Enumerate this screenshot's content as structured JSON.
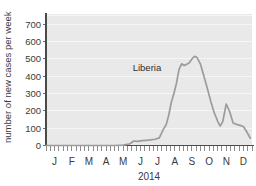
{
  "chart_data": {
    "type": "line",
    "title": "",
    "subtitle": "",
    "xlabel": "2014",
    "ylabel": "number of new cases per week",
    "ylim": [
      0,
      760
    ],
    "ytick_values": [
      0,
      100,
      200,
      300,
      400,
      500,
      600,
      700
    ],
    "ytick_labels": [
      "0",
      "100",
      "200",
      "300",
      "400",
      "500",
      "600",
      "700"
    ],
    "xtick_labels": [
      "J",
      "F",
      "M",
      "A",
      "M",
      "J",
      "J",
      "A",
      "S",
      "O",
      "N",
      "D"
    ],
    "xtick_full_names": [
      "January",
      "February",
      "March",
      "April",
      "May",
      "June",
      "July",
      "August",
      "September",
      "October",
      "November",
      "December"
    ],
    "xlim_months": [
      0,
      12
    ],
    "grid": "horizontal-light",
    "legend_position": "inline-annotation",
    "minor_ticks_per_month": 4,
    "plot_background_color": "#e9e9e9",
    "line_color": "#9c9c9c",
    "axis_color": "#4a4a4a",
    "text_color": "#3a3a3a",
    "series": [
      {
        "name": "Liberia",
        "annotation_label": "Liberia",
        "annotation_x_month": 5.05,
        "annotation_y_value": 430,
        "x_months": [
          0.0,
          0.5,
          1.0,
          1.5,
          2.0,
          2.5,
          3.0,
          3.5,
          4.0,
          4.5,
          4.9,
          5.1,
          5.35,
          5.6,
          5.85,
          6.1,
          6.35,
          6.6,
          6.85,
          7.0,
          7.15,
          7.3,
          7.45,
          7.6,
          7.75,
          7.9,
          8.05,
          8.2,
          8.35,
          8.5,
          8.65,
          8.8,
          9.0,
          9.2,
          9.4,
          9.6,
          9.8,
          10.0,
          10.15,
          10.3,
          10.5,
          10.7,
          10.9,
          11.1,
          11.3,
          11.5,
          11.7,
          11.9
        ],
        "values": [
          0,
          0,
          0,
          0,
          0,
          0,
          0,
          0,
          0,
          2,
          10,
          26,
          24,
          28,
          30,
          32,
          36,
          44,
          96,
          120,
          175,
          250,
          300,
          360,
          440,
          472,
          462,
          470,
          478,
          500,
          515,
          508,
          470,
          400,
          330,
          255,
          190,
          140,
          112,
          140,
          240,
          195,
          130,
          122,
          116,
          110,
          78,
          42
        ]
      }
    ]
  },
  "axes": {
    "y_axis_label": "number of new cases per week",
    "x_axis_label": "2014"
  }
}
